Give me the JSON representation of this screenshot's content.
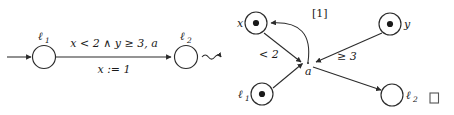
{
  "figure": {
    "kind": "timed-automaton-to-petri-net-translation",
    "relation_symbol": "⤳",
    "qed_symbol": "□"
  },
  "automaton": {
    "title": "timed automaton edge",
    "initial_arrow": "→",
    "states": [
      {
        "id": "l1",
        "label": "ℓ",
        "subscript": "1",
        "role": "source",
        "initial": true
      },
      {
        "id": "l2",
        "label": "ℓ",
        "subscript": "2",
        "role": "target",
        "initial": false
      }
    ],
    "edge": {
      "guard": "x < 2 ∧ y ≥ 3, a",
      "guard_parts": {
        "clock_x": "x",
        "op_x": "<",
        "bound_x": "2",
        "conjunction": "∧",
        "clock_y": "y",
        "op_y": "≥",
        "bound_y": "3",
        "action": "a"
      },
      "update": "x := 1",
      "update_parts": {
        "clock": "x",
        "assign_op": ":=",
        "value": "1"
      }
    }
  },
  "petri_net": {
    "title": "resulting net",
    "places": [
      {
        "id": "x",
        "label": "x",
        "tokens": 1,
        "label_side": "left",
        "marked": true
      },
      {
        "id": "y",
        "label": "y",
        "tokens": 1,
        "label_side": "right",
        "marked": true
      },
      {
        "id": "l1",
        "label": "ℓ",
        "subscript": "1",
        "tokens": 1,
        "label_side": "left",
        "marked": true
      },
      {
        "id": "l2",
        "label": "ℓ",
        "subscript": "2",
        "tokens": 0,
        "label_side": "right",
        "marked": false
      }
    ],
    "transitions": [
      {
        "id": "a",
        "label": "a"
      }
    ],
    "arcs": [
      {
        "id": "arc-l1-a",
        "from": "l1",
        "to": "a",
        "label": "",
        "direction": "in"
      },
      {
        "id": "arc-x-a",
        "from": "x",
        "to": "a",
        "label": "< 2",
        "direction": "in"
      },
      {
        "id": "arc-y-a",
        "from": "y",
        "to": "a",
        "label": "≥ 3",
        "direction": "in"
      },
      {
        "id": "arc-a-l2",
        "from": "a",
        "to": "l2",
        "label": "",
        "direction": "out"
      },
      {
        "id": "arc-a-x",
        "from": "a",
        "to": "x",
        "label": "[1]",
        "direction": "out",
        "curved": true
      }
    ]
  }
}
